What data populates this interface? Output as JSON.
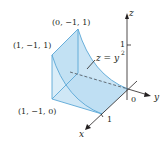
{
  "figure": {
    "colors": {
      "fill_light": "#d6ebf7",
      "fill_mid": "#b9dcf1",
      "edge": "#5aa7d6",
      "axis": "#231f20",
      "text": "#231f20"
    },
    "vertices": {
      "top": "(0, −1, 1)",
      "upper_left": "(1, −1, 1)",
      "lower_left": "(1, −1, 0)"
    },
    "surface_label": {
      "lhs": "z = y",
      "exponent": "2"
    },
    "axes": {
      "x": "x",
      "y": "y",
      "z": "z",
      "origin": "0",
      "z_tick": "1",
      "x_tick": "1"
    }
  }
}
